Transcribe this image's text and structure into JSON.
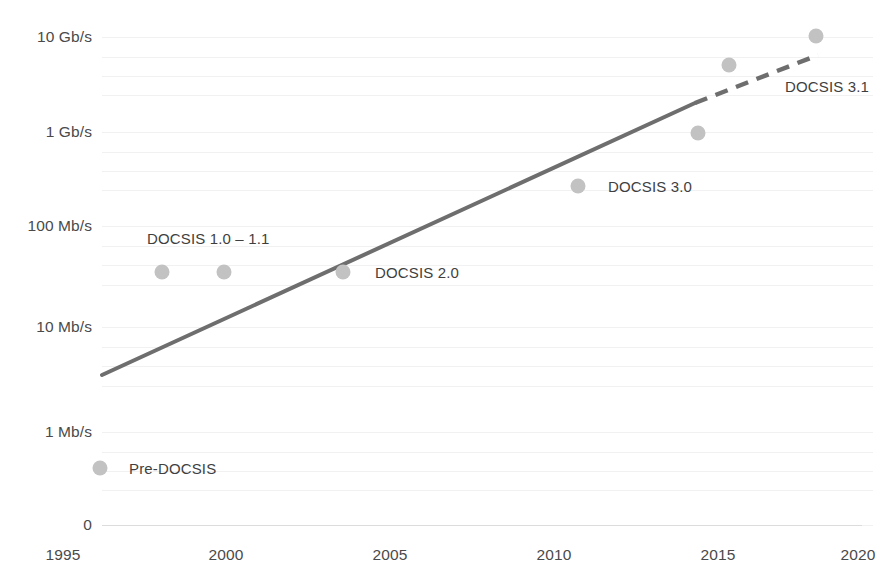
{
  "chart_data": {
    "type": "scatter",
    "title": "",
    "subtitle": "",
    "xlabel": "",
    "ylabel": "",
    "grid": true,
    "legend_position": "none",
    "yscale": "log",
    "xlim": [
      1995,
      2020
    ],
    "ylim_labels": [
      "0",
      "1 Mb/s",
      "10 Mb/s",
      "100 Mb/s",
      "1 Gb/s",
      "10 Gb/s"
    ],
    "x_ticks": [
      "1995",
      "2000",
      "2005",
      "2010",
      "2015",
      "2020"
    ],
    "y_ticks": [
      "10 Gb/s",
      "1 Gb/s",
      "100 Mb/s",
      "10 Mb/s",
      "1 Mb/s",
      "0"
    ],
    "annotations": [
      "Pre-DOCSIS",
      "DOCSIS 1.0 – 1.1",
      "DOCSIS 2.0",
      "DOCSIS 3.0",
      "DOCSIS 3.1"
    ],
    "points": [
      {
        "label": "Pre-DOCSIS",
        "x": 1995,
        "y_text": "0.5 Mb/s",
        "px": 100,
        "py": 468
      },
      {
        "label": "DOCSIS 1.0",
        "x": 1997,
        "y_text": "40 Mb/s",
        "px": 162,
        "py": 272
      },
      {
        "label": "DOCSIS 1.1",
        "x": 1999,
        "y_text": "40 Mb/s",
        "px": 224,
        "py": 272
      },
      {
        "label": "DOCSIS 2.0",
        "x": 2003,
        "y_text": "40 Mb/s",
        "px": 343,
        "py": 272
      },
      {
        "label": "DOCSIS 3.0",
        "x": 2011,
        "y_text": "300 Mb/s",
        "px": 578,
        "py": 186
      },
      {
        "label": "DOCSIS 3.0 high",
        "x": 2015,
        "y_text": "900 Mb/s",
        "px": 698,
        "py": 133
      },
      {
        "label": "DOCSIS 3.1",
        "x": 2016,
        "y_text": "5 Gb/s",
        "px": 729,
        "py": 65
      },
      {
        "label": "DOCSIS 3.1 full duplex",
        "x": 2019,
        "y_text": "10 Gb/s",
        "px": 816,
        "py": 36
      }
    ],
    "trend": {
      "solid": {
        "x1": 102,
        "y1": 375,
        "x2": 695,
        "y2": 103
      },
      "dashed": {
        "x1": 695,
        "y1": 103,
        "x2": 818,
        "y2": 55
      },
      "color": "#6e6e6e",
      "width": 4
    },
    "colors": {
      "dot": "#c2c2c2",
      "trend_line": "#6e6e6e",
      "text": "#4a4a4a",
      "grid": "#f1f1f1",
      "axis": "#dcdcdc",
      "background": "#ffffff"
    }
  },
  "yaxis": {
    "ticks": [
      {
        "label": "10 Gb/s",
        "py": 37
      },
      {
        "label": "1 Gb/s",
        "py": 132
      },
      {
        "label": "100 Mb/s",
        "py": 226
      },
      {
        "label": "10 Mb/s",
        "py": 327
      },
      {
        "label": "1 Mb/s",
        "py": 432
      },
      {
        "label": "0",
        "py": 525
      }
    ]
  },
  "xaxis": {
    "ticks": [
      {
        "label": "1995",
        "px": 63
      },
      {
        "label": "2000",
        "px": 226
      },
      {
        "label": "2005",
        "px": 390
      },
      {
        "label": "2010",
        "px": 554
      },
      {
        "label": "2015",
        "px": 718
      },
      {
        "label": "2020",
        "px": 858
      }
    ]
  },
  "point_labels": [
    {
      "text": "DOCSIS 1.0 – 1.1",
      "px": 147,
      "py": 238
    },
    {
      "text": "DOCSIS 2.0",
      "px": 375,
      "py": 272
    },
    {
      "text": "DOCSIS 3.0",
      "px": 608,
      "py": 186
    },
    {
      "text": "DOCSIS 3.1",
      "px": 785,
      "py": 86
    },
    {
      "text": "Pre-DOCSIS",
      "px": 129,
      "py": 468
    }
  ],
  "gridlines_py": [
    37,
    57,
    76,
    95,
    132,
    152,
    171,
    190,
    226,
    246,
    265,
    285,
    327,
    347,
    366,
    386,
    432,
    452,
    471,
    490,
    525
  ]
}
